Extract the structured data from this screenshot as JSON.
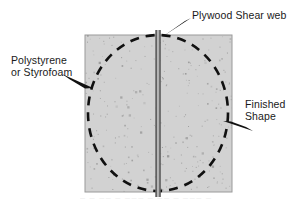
{
  "figure": {
    "type": "technical-cross-section-diagram",
    "canvas": {
      "width": 308,
      "height": 201,
      "background": "#ffffff"
    },
    "block": {
      "name": "foam-block",
      "x": 85,
      "y": 35,
      "width": 147,
      "height": 157,
      "fill": "#d2d2d2",
      "border": "#9a9a9a",
      "speckle_color": "#8a8a8a",
      "speckle_count": 300
    },
    "finished_shape": {
      "name": "dashed-ellipse",
      "cx": 158,
      "cy": 113,
      "rx": 70,
      "ry": 78,
      "stroke": "#111111",
      "stroke_width": 2.6,
      "dash": "9 7"
    },
    "shear_web": {
      "name": "plywood-web",
      "cx": 158,
      "top": 30,
      "bottom": 197,
      "total_width": 5,
      "edge_color": "#3a3a3a",
      "core_color": "#c9c9c9"
    },
    "arrows": [
      {
        "name": "arrow-to-polystyrene",
        "from": [
          62,
          74
        ],
        "to": [
          92,
          88
        ],
        "color": "#111111"
      },
      {
        "name": "arrow-to-plywood-web",
        "from": [
          190,
          19
        ],
        "to": [
          163,
          36
        ],
        "color": "#111111"
      },
      {
        "name": "arrow-to-finished-shape",
        "from": [
          252,
          130
        ],
        "to": [
          224,
          122
        ],
        "color": "#111111"
      }
    ]
  },
  "labels": {
    "polystyrene": {
      "line1": "Polystyrene",
      "line2": "or Styrofoam"
    },
    "plywood": {
      "line1": "Plywood Shear web"
    },
    "finished": {
      "line1": "Finished",
      "line2": "Shape"
    }
  },
  "caption": {
    "partial_text": "— — —— — ——— — —— — ——— —"
  },
  "colors": {
    "foam_fill": "#d2d2d2",
    "foam_speckle": "#8a8a8a",
    "ink": "#111111",
    "web_edge": "#3a3a3a",
    "web_core": "#c9c9c9",
    "page_background": "#ffffff"
  }
}
